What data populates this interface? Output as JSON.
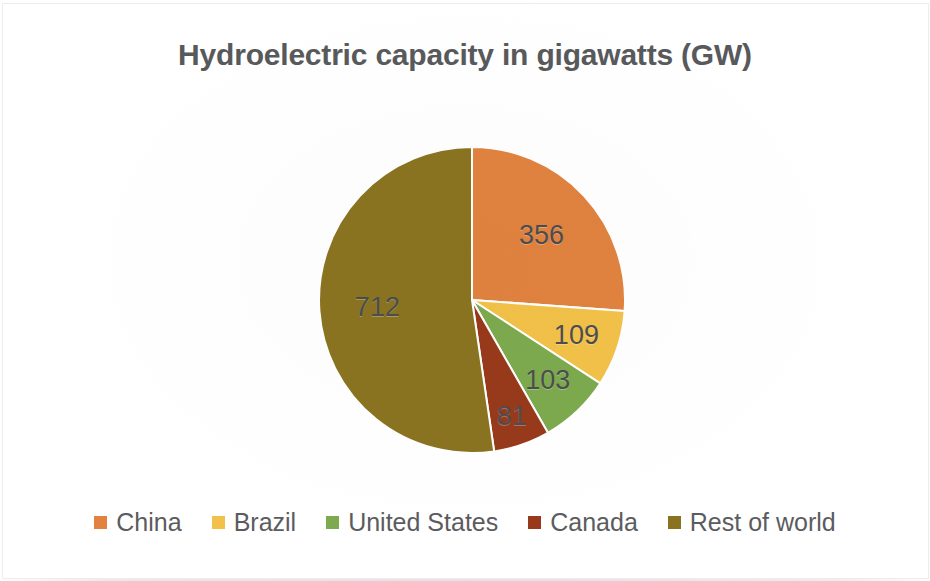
{
  "chart_data": {
    "type": "pie",
    "title": "Hydroelectric capacity in gigawatts (GW)",
    "xlabel": "",
    "ylabel": "",
    "unit": "GW",
    "total": 1361,
    "legend_position": "bottom",
    "grid": false,
    "start_angle_deg": 0,
    "direction": "clockwise",
    "categories": [
      "China",
      "Brazil",
      "United States",
      "Canada",
      "Rest of world"
    ],
    "values": [
      356,
      109,
      103,
      81,
      712
    ],
    "data_labels": [
      "356",
      "109",
      "103",
      "81",
      "712"
    ],
    "colors": [
      "#E1823F",
      "#F2C149",
      "#7DAA4E",
      "#98391B",
      "#8A7320"
    ],
    "slices": [
      {
        "label": "China",
        "value": 356,
        "data_label": "356",
        "color": "#E1823F"
      },
      {
        "label": "Brazil",
        "value": 109,
        "data_label": "109",
        "color": "#F2C149"
      },
      {
        "label": "United States",
        "value": 103,
        "data_label": "103",
        "color": "#7DAA4E"
      },
      {
        "label": "Canada",
        "value": 81,
        "data_label": "81",
        "color": "#98391B"
      },
      {
        "label": "Rest of world",
        "value": 712,
        "data_label": "712",
        "color": "#8A7320"
      }
    ]
  },
  "title": {
    "text": "Hydroelectric capacity in gigawatts (GW)"
  },
  "labels": {
    "china": "356",
    "brazil": "109",
    "united_states": "103",
    "canada": "81",
    "rest_of_world": "712"
  },
  "legend": {
    "items": [
      {
        "label": "China",
        "color": "#E1823F"
      },
      {
        "label": "Brazil",
        "color": "#F2C149"
      },
      {
        "label": "United States",
        "color": "#7DAA4E"
      },
      {
        "label": "Canada",
        "color": "#98391B"
      },
      {
        "label": "Rest of world",
        "color": "#8A7320"
      }
    ]
  },
  "theme": {
    "background": "#FFFFFF",
    "title_color": "#58595B",
    "label_color": "#4D4D4F",
    "legend_text_color": "#5B5C5E",
    "slice_gap_color": "#FFFFFF"
  }
}
